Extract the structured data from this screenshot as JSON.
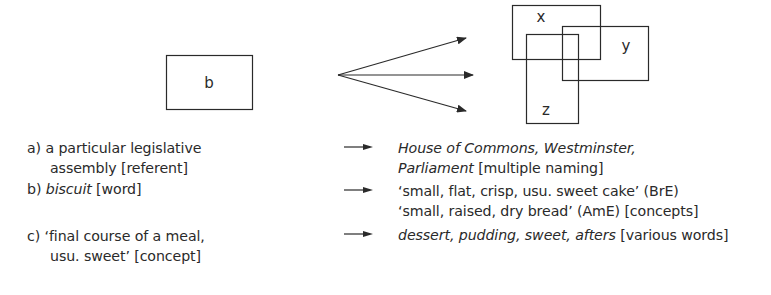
{
  "diagram": {
    "source_box": {
      "label": "b"
    },
    "target_boxes": [
      {
        "label": "x"
      },
      {
        "label": "y"
      },
      {
        "label": "z"
      }
    ],
    "arrow_count": 3,
    "stroke_color": "#2a2a2a"
  },
  "examples": [
    {
      "left": {
        "line1": "a) a particular legislative",
        "line2": "assembly [referent]"
      },
      "right": {
        "line1_italic": "House of Commons, Westminster,",
        "line2_italic": "Parliament",
        "line2_plain": " [multiple naming]"
      }
    },
    {
      "left": {
        "prefix": "b) ",
        "italic": "biscuit",
        "suffix": " [word]"
      },
      "right": {
        "line1": "‘small, flat, crisp, usu. sweet cake’ (BrE)",
        "line2": "‘small, raised, dry bread’ (AmE) [concepts]"
      }
    },
    {
      "left": {
        "line1": "c) ‘final course of a meal,",
        "line2": "usu. sweet’ [concept]"
      },
      "right": {
        "italic": "dessert, pudding, sweet, afters",
        "plain": " [various words]"
      }
    }
  ]
}
